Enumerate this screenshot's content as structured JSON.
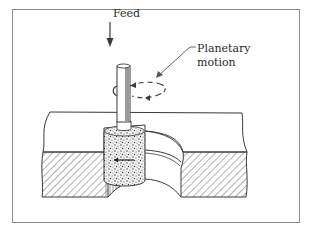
{
  "figure": {
    "labels": {
      "feed": "Feed",
      "planetary_line1": "Planetary",
      "planetary_line2": "motion"
    },
    "colors": {
      "ink": "#3a3a3a",
      "frame": "#8a8a8a",
      "background": "#ffffff",
      "spindle_shade": "#9a9a9a"
    }
  }
}
